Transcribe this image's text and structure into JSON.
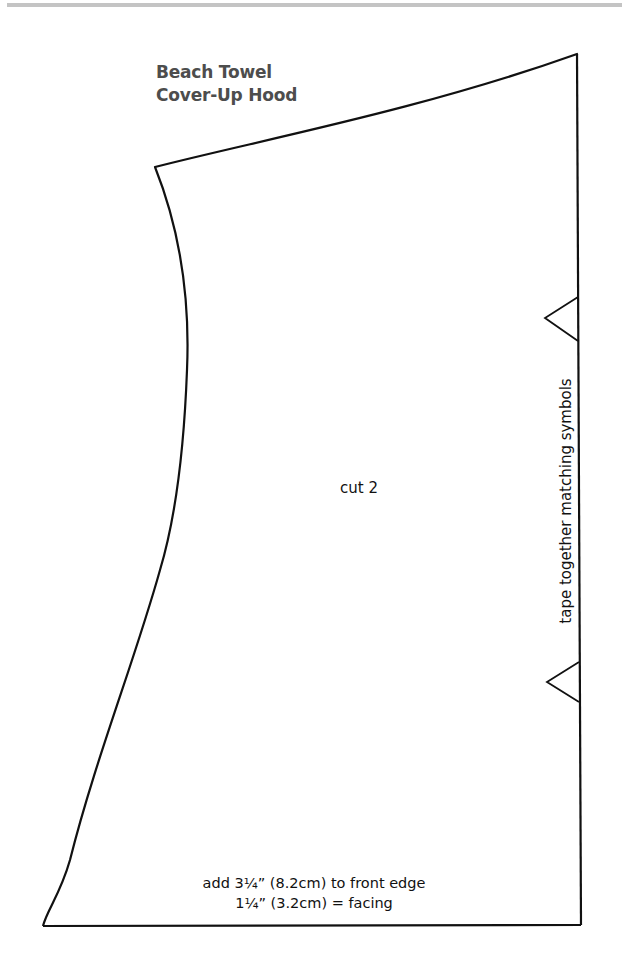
{
  "page": {
    "title_lines": [
      "Beach Towel",
      "Cover-Up Hood"
    ],
    "title_color": "#4d4d4d",
    "rule_color": "#c4c4c4"
  },
  "pattern_piece": {
    "cut_instruction": "cut 2",
    "side_note": "tape together matching symbols",
    "bottom_note_lines": [
      "add 3¼” (8.2cm) to front edge",
      "1¼” (3.2cm) = facing"
    ],
    "outline_color": "#111111",
    "match_symbols": [
      {
        "name": "upper-notch",
        "shape": "triangle"
      },
      {
        "name": "lower-notch",
        "shape": "triangle"
      }
    ]
  }
}
